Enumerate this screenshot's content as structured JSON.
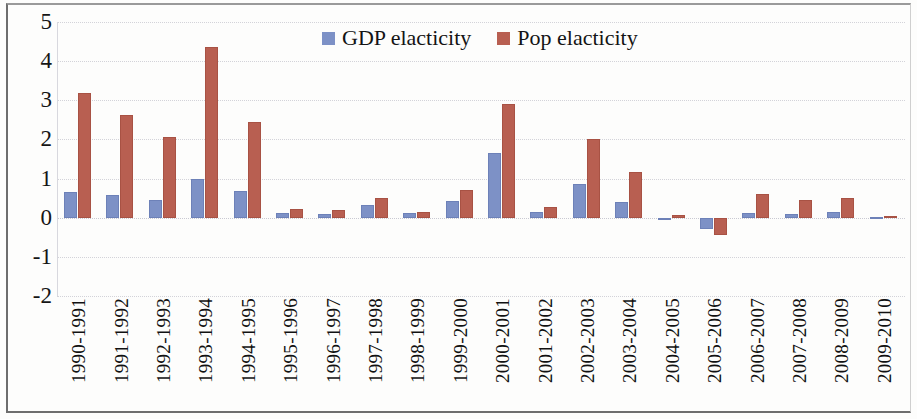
{
  "chart_data": {
    "type": "bar",
    "title": "",
    "xlabel": "",
    "ylabel": "",
    "ylim": [
      -2,
      5
    ],
    "yticks": [
      5,
      4,
      3,
      2,
      1,
      0,
      -1,
      -2
    ],
    "grid": true,
    "legend_position": "top-center",
    "colors": {
      "gdp": "#7d91c6",
      "pop": "#b85f51"
    },
    "categories": [
      "1990-1991",
      "1991-1992",
      "1992-1993",
      "1993-1994",
      "1994-1995",
      "1995-1996",
      "1996-1997",
      "1997-1998",
      "1998-1999",
      "1999-2000",
      "2000-2001",
      "2001-2002",
      "2002-2003",
      "2003-2004",
      "2004-2005",
      "2005-2006",
      "2006-2007",
      "2007-2008",
      "2008-2009",
      "2009-2010"
    ],
    "series": [
      {
        "name": "GDP elacticity",
        "key": "gdp",
        "values": [
          0.66,
          0.57,
          0.46,
          1.0,
          0.68,
          0.12,
          0.1,
          0.33,
          0.12,
          0.42,
          1.65,
          0.14,
          0.86,
          0.41,
          -0.04,
          -0.3,
          0.12,
          0.09,
          0.14,
          0.03
        ]
      },
      {
        "name": "Pop elacticity",
        "key": "pop",
        "values": [
          3.19,
          2.63,
          2.07,
          4.36,
          2.44,
          0.23,
          0.19,
          0.51,
          0.15,
          0.7,
          2.91,
          0.28,
          2.0,
          1.16,
          0.08,
          -0.45,
          0.6,
          0.45,
          0.51,
          0.04
        ]
      }
    ]
  },
  "legend": {
    "items": [
      {
        "label": "GDP elacticity",
        "key": "gdp"
      },
      {
        "label": "Pop elacticity",
        "key": "pop"
      }
    ]
  }
}
